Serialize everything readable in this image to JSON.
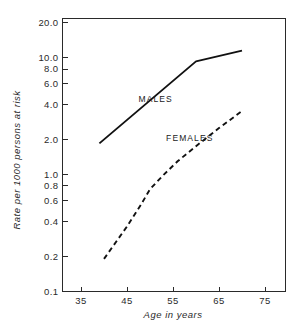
{
  "chart_data": {
    "type": "line",
    "title": "",
    "subtitle": "",
    "xlabel": "Age in years",
    "ylabel": "Rate per 1000 persons at risk",
    "xscale": "linear",
    "yscale": "log",
    "xlim": [
      30,
      79
    ],
    "ylim": [
      0.1,
      20.0
    ],
    "grid": false,
    "legend_position": "inline-annotation",
    "xticks": [
      35,
      45,
      55,
      65,
      75
    ],
    "xtick_labels": [
      "35",
      "45",
      "55",
      "65",
      "75"
    ],
    "yticks": [
      20.0,
      10.0,
      8.0,
      6.0,
      4.0,
      2.0,
      1.0,
      0.8,
      0.6,
      0.4,
      0.2,
      0.1
    ],
    "ytick_labels": [
      "20.0",
      "10.0",
      "8.0",
      "6.0",
      "4.0",
      "2.0",
      "1.0",
      "0.8",
      "0.6",
      "0.4",
      "0.2",
      "0.1"
    ],
    "series": [
      {
        "name": "MALES",
        "style": "solid",
        "x": [
          39,
          60,
          70
        ],
        "values": [
          1.85,
          9.3,
          11.5
        ]
      },
      {
        "name": "FEMALES",
        "style": "dashed",
        "x": [
          40,
          45,
          48,
          50,
          53,
          56,
          60,
          65,
          70
        ],
        "values": [
          0.19,
          0.36,
          0.55,
          0.75,
          1.0,
          1.3,
          1.75,
          2.5,
          3.5
        ]
      }
    ],
    "annotations": [
      {
        "text": "MALES",
        "x": 47.5,
        "y": 4.2
      },
      {
        "text": "FEMALES",
        "x": 53.5,
        "y": 1.95
      }
    ]
  },
  "axis_titles": {
    "x": "Age in years",
    "y": "Rate per 1000 persons at risk"
  }
}
